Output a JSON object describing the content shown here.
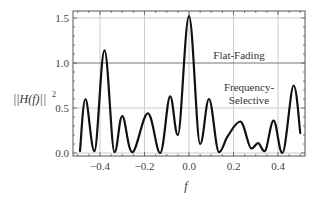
{
  "chart_data": {
    "type": "line",
    "title": "",
    "xlabel": "f",
    "ylabel": "||H(f)||²",
    "xlim": [
      -0.52,
      0.52
    ],
    "ylim": [
      -0.03,
      1.6
    ],
    "grid": true,
    "x_ticks": [
      "-0.4",
      "-0.2",
      "0.0",
      "0.2",
      "0.4"
    ],
    "x_tick_values": [
      -0.4,
      -0.2,
      0.0,
      0.2,
      0.4
    ],
    "y_ticks": [
      "0.0",
      "0.5",
      "1.0",
      "1.5"
    ],
    "y_tick_values": [
      0.0,
      0.5,
      1.0,
      1.5
    ],
    "series": [
      {
        "name": "Frequency-Selective",
        "x": [
          -0.49,
          -0.465,
          -0.425,
          -0.38,
          -0.335,
          -0.3,
          -0.255,
          -0.185,
          -0.13,
          -0.085,
          -0.05,
          0.0,
          0.05,
          0.09,
          0.135,
          0.175,
          0.23,
          0.28,
          0.31,
          0.34,
          0.38,
          0.42,
          0.47,
          0.5
        ],
        "values": [
          0.02,
          0.6,
          0.02,
          1.14,
          0.01,
          0.41,
          0.01,
          0.44,
          0.0,
          0.63,
          0.2,
          1.52,
          0.1,
          0.6,
          0.01,
          0.19,
          0.35,
          0.05,
          0.11,
          0.02,
          0.36,
          0.0,
          0.75,
          0.22
        ]
      },
      {
        "name": "Flat-Fading",
        "x": [
          -0.52,
          0.52
        ],
        "values": [
          1.0,
          1.0
        ]
      }
    ],
    "annotations": [
      {
        "text": "Flat-Fading",
        "x": 0.22,
        "y": 1.06
      },
      {
        "text": "Frequency-",
        "x": 0.27,
        "y": 0.72
      },
      {
        "text": "Selective",
        "x": 0.27,
        "y": 0.58
      }
    ]
  },
  "labels": {
    "ylabel_main": "||H(f)||",
    "ylabel_sup": "2",
    "xlabel": "f",
    "flat": "Flat-Fading",
    "fs_line1": "Frequency-",
    "fs_line2": "Selective"
  },
  "colors": {
    "curve": "#111111",
    "grid": "#cccccc",
    "frame": "#555555",
    "flat_line": "#777777"
  }
}
